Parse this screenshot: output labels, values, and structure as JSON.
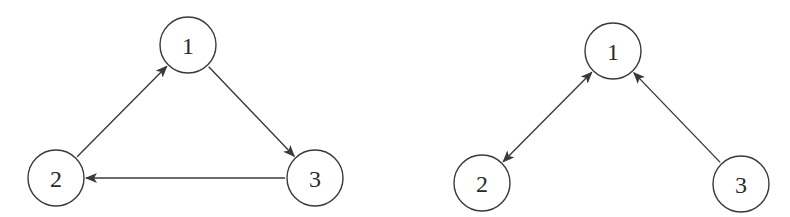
{
  "colors": {
    "background": "#ffffff",
    "stroke": "#3a3a3a",
    "text": "#2a2a2a"
  },
  "node_radius": 28,
  "graphs": [
    {
      "id": "left",
      "nodes": [
        {
          "id": "1",
          "label": "1",
          "x": 188,
          "y": 45
        },
        {
          "id": "2",
          "label": "2",
          "x": 56,
          "y": 178
        },
        {
          "id": "3",
          "label": "3",
          "x": 315,
          "y": 178
        }
      ],
      "edges": [
        {
          "from": "2",
          "to": "1",
          "directed": true,
          "bidirectional": false
        },
        {
          "from": "1",
          "to": "3",
          "directed": true,
          "bidirectional": false
        },
        {
          "from": "3",
          "to": "2",
          "directed": true,
          "bidirectional": false
        }
      ]
    },
    {
      "id": "right",
      "nodes": [
        {
          "id": "1",
          "label": "1",
          "x": 613,
          "y": 51
        },
        {
          "id": "2",
          "label": "2",
          "x": 482,
          "y": 183
        },
        {
          "id": "3",
          "label": "3",
          "x": 741,
          "y": 184
        }
      ],
      "edges": [
        {
          "from": "1",
          "to": "2",
          "directed": true,
          "bidirectional": true
        },
        {
          "from": "3",
          "to": "1",
          "directed": true,
          "bidirectional": false
        }
      ]
    }
  ]
}
